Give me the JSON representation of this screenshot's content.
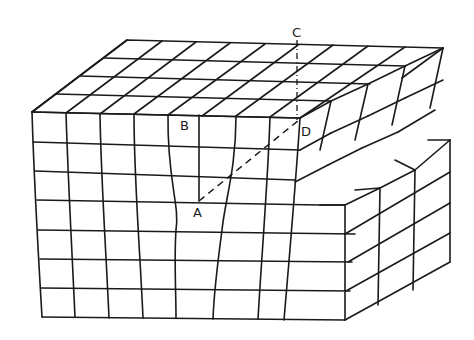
{
  "figure": {
    "stroke_color": "#1a1a1a",
    "background": "#ffffff"
  },
  "labels": {
    "A": {
      "text": "A",
      "x": 193,
      "y": 206
    },
    "B": {
      "text": "B",
      "x": 180,
      "y": 119
    },
    "C": {
      "text": "C",
      "x": 292,
      "y": 26
    },
    "D": {
      "text": "D",
      "x": 301,
      "y": 125
    }
  },
  "lines": {
    "AD": {
      "style": "dashed",
      "from": [
        199,
        201
      ],
      "to": [
        299,
        120
      ]
    },
    "AB": {
      "style": "solid",
      "from": [
        199,
        201
      ],
      "to": [
        199,
        115
      ]
    },
    "CD": {
      "style": "dash-dot",
      "from": [
        297,
        45
      ],
      "to": [
        297,
        120
      ]
    }
  },
  "top_face": {
    "back_left": [
      127,
      40
    ],
    "back_right": [
      443,
      48
    ],
    "front_left": [
      32,
      112
    ],
    "rows": 4,
    "cols": 9
  },
  "front_face_rows_y": [
    112,
    142,
    171,
    200,
    230,
    259,
    288,
    317
  ],
  "lower_block": {
    "top_y": 205,
    "right_x": 450
  }
}
